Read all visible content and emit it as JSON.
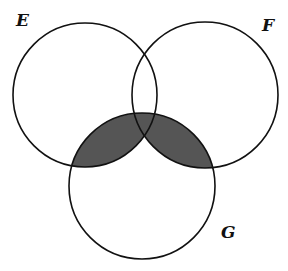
{
  "diagram": {
    "type": "venn",
    "sets": [
      {
        "label": "E",
        "cx": 85,
        "cy": 95,
        "r": 72
      },
      {
        "label": "F",
        "cx": 205,
        "cy": 95,
        "r": 73
      },
      {
        "label": "G",
        "cx": 142,
        "cy": 186,
        "r": 73
      }
    ],
    "shaded_region": "(E ∩ G) ∪ (F ∩ G)",
    "colors": {
      "stroke": "#111111",
      "shade": "#555555",
      "background": "#ffffff"
    }
  },
  "labels": {
    "e": "E",
    "f": "F",
    "g": "G"
  }
}
